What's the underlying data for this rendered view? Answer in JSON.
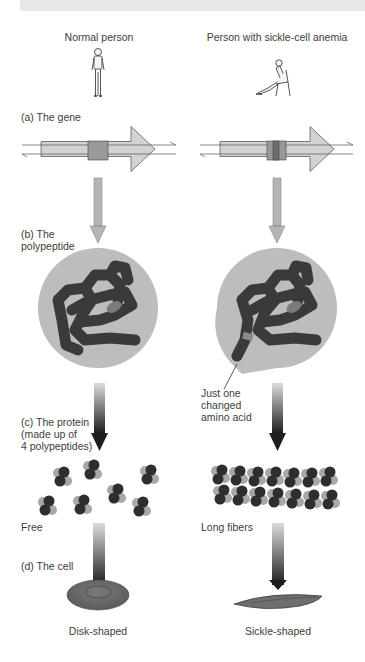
{
  "columns": {
    "left_title": "Normal person",
    "right_title": "Person with sickle-cell anemia"
  },
  "stages": {
    "a": "(a)  The gene",
    "b_line1": "(b)  The",
    "b_line2": "polypeptide",
    "c_line1": "(c)  The protein",
    "c_line2": "(made up of",
    "c_line3": "4 polypeptides)",
    "d": "(d)  The cell"
  },
  "annotations": {
    "mutation_line1": "Just one",
    "mutation_line2": "changed",
    "mutation_line3": "amino acid",
    "left_protein_state": "Free",
    "right_protein_state": "Long fibers",
    "left_cell_shape": "Disk-shaped",
    "right_cell_shape": "Sickle-shaped"
  },
  "colors": {
    "header_bar": "#e8e8e8",
    "gene_arrow": "#d2d2d2",
    "gene_segment": "#999999",
    "flow_arrow": "#b5b5b5",
    "polypeptide_bg": "#bdbdbd",
    "polypeptide_chain": "#3a3a3a",
    "protein_dark": "#2e2e2e",
    "protein_light": "#a8a8a8",
    "cell": "#6e6e6e"
  }
}
